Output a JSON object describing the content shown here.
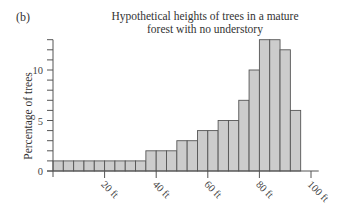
{
  "panel_label": "(b)",
  "chart_data": {
    "type": "bar",
    "title": "Hypothetical heights of trees in a mature forest with no understory",
    "title_lines": [
      "Hypothetical heights of trees in a mature",
      "forest with no understory"
    ],
    "xlabel": "",
    "ylabel": "Percentage of trees",
    "bin_width_ft": 4,
    "categories": [
      "0-4",
      "4-8",
      "8-12",
      "12-16",
      "16-20",
      "20-24",
      "24-28",
      "28-32",
      "32-36",
      "36-40",
      "40-44",
      "44-48",
      "48-52",
      "52-56",
      "56-60",
      "60-64",
      "64-68",
      "68-72",
      "72-76",
      "76-80",
      "80-84",
      "84-88",
      "88-92",
      "92-96"
    ],
    "values": [
      1,
      1,
      1,
      1,
      1,
      1,
      1,
      1,
      1,
      2,
      2,
      2,
      3,
      3,
      4,
      4,
      5,
      5,
      7,
      10,
      13,
      13,
      12,
      6
    ],
    "xlim": [
      0,
      100
    ],
    "ylim": [
      0,
      13
    ],
    "x_ticks": [
      20,
      40,
      60,
      80,
      100
    ],
    "x_tick_labels": [
      "20 ft",
      "40 ft",
      "60 ft",
      "80 ft",
      "100 ft"
    ],
    "y_ticks_labeled": [
      0,
      5,
      10
    ],
    "y_tick_labels": [
      "0",
      "5",
      "10"
    ],
    "y_minor_tick_step": 1,
    "grid": false,
    "legend": null,
    "bar_color": "#cccccc",
    "edge_color": "#555555"
  }
}
